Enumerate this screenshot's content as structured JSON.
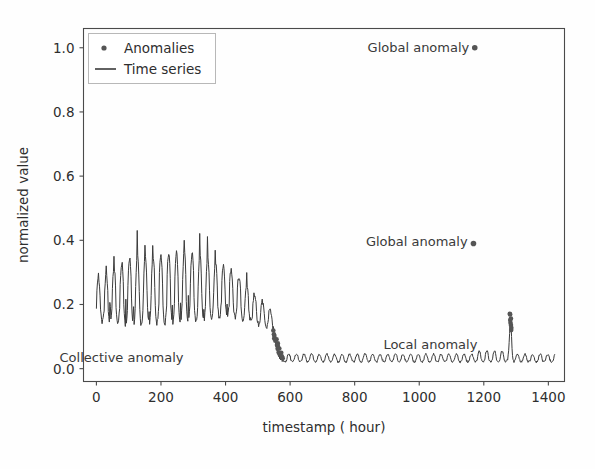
{
  "chart_data": {
    "type": "line",
    "title": "",
    "xlabel": "timestamp ( hour)",
    "ylabel": "normalized value",
    "xlim": [
      -40,
      1450
    ],
    "ylim": [
      -0.04,
      1.06
    ],
    "xticks": [
      0,
      200,
      400,
      600,
      800,
      1000,
      1200,
      1400
    ],
    "xticklabels": [
      "0",
      "200",
      "400",
      "600",
      "800",
      "1000",
      "1200",
      "1400"
    ],
    "yticks": [
      0.0,
      0.2,
      0.4,
      0.6,
      0.8,
      1.0
    ],
    "yticklabels": [
      "0.0",
      "0.2",
      "0.4",
      "0.6",
      "0.8",
      "1.0"
    ],
    "grid": false,
    "legend": {
      "position": "upper left",
      "entries": [
        {
          "label": "Anomalies",
          "marker": "dot",
          "color": "#555555"
        },
        {
          "label": "Time series",
          "marker": "line",
          "color": "#3b3b3b"
        }
      ]
    },
    "series": [
      {
        "name": "Time series",
        "color": "#3b3b3b",
        "description": "High-amplitude oscillation (mean ~0.22, peaks to 0.47) from t=0 to t~545, then an abrupt level shift down to a low-amplitude oscillation (mean ~0.03) from t~560 to t=1420, with a single sharp local spike reaching ~0.15 at t~1283."
      }
    ],
    "annotations": [
      {
        "name": "global-anomaly-top",
        "text": "Global anomaly",
        "text_x": 1155,
        "text_y": 1.0,
        "point_x": 1172,
        "point_y": 1.0
      },
      {
        "name": "global-anomaly-mid",
        "text": "Global anomaly",
        "text_x": 1150,
        "text_y": 0.395,
        "point_x": 1168,
        "point_y": 0.39
      },
      {
        "name": "local-anomaly",
        "text": "Local anomaly",
        "text_x": 1180,
        "text_y": 0.075,
        "point_x": 1283,
        "point_y": 0.12
      },
      {
        "name": "collective-anomaly",
        "text": "Collective anomaly",
        "text_x": 270,
        "text_y": 0.035,
        "point_x": 555,
        "point_y": 0.07
      }
    ],
    "anomaly_points": {
      "color": "#555555",
      "groups": [
        {
          "name": "global-top",
          "points": [
            [
              1172,
              1.0
            ]
          ]
        },
        {
          "name": "global-mid",
          "points": [
            [
              1168,
              0.39
            ]
          ]
        },
        {
          "name": "collective-cluster",
          "x_range": [
            548,
            575
          ],
          "y_range": [
            0.03,
            0.115
          ],
          "count": 16
        },
        {
          "name": "local-cluster",
          "x_range": [
            1278,
            1288
          ],
          "y_range": [
            0.12,
            0.175
          ],
          "count": 8
        }
      ]
    }
  },
  "axis": {
    "ylabel": "normalized value",
    "xlabel": "timestamp ( hour)"
  },
  "colors": {
    "line": "#3b3b3b",
    "marker": "#555555",
    "spine": "#4a4a4a",
    "background": "#fefefe"
  }
}
